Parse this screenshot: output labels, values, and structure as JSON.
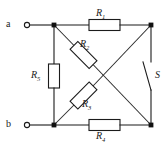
{
  "diagram": {
    "type": "electrical-schematic",
    "stroke_color": "#1b1b1b",
    "background_color": "#ffffff"
  },
  "terminals": [
    {
      "id": "a",
      "label": "a",
      "position": "top-left",
      "x": 24,
      "y": 25
    },
    {
      "id": "b",
      "label": "b",
      "position": "bottom-left",
      "x": 24,
      "y": 125
    }
  ],
  "nodes": [
    {
      "id": "top-left",
      "x": 54,
      "y": 25
    },
    {
      "id": "top-right",
      "x": 151,
      "y": 25
    },
    {
      "id": "bottom-left",
      "x": 54,
      "y": 125
    },
    {
      "id": "bottom-right",
      "x": 151,
      "y": 125
    }
  ],
  "components": [
    {
      "id": "R1",
      "label": "R",
      "subscript": "1",
      "kind": "resistor",
      "orientation": "horizontal",
      "branch": "top-wire",
      "label_position": "above"
    },
    {
      "id": "R2",
      "label": "R",
      "subscript": "2",
      "kind": "resistor",
      "orientation": "diagonal",
      "branch": "top-left-to-bottom-right-diagonal",
      "label_position": "right"
    },
    {
      "id": "R3",
      "label": "R",
      "subscript": "3",
      "kind": "resistor",
      "orientation": "diagonal",
      "branch": "bottom-left-to-top-right-diagonal",
      "label_position": "right"
    },
    {
      "id": "R4",
      "label": "R",
      "subscript": "4",
      "kind": "resistor",
      "orientation": "horizontal",
      "branch": "bottom-wire",
      "label_position": "below"
    },
    {
      "id": "R5",
      "label": "R",
      "subscript": "5",
      "kind": "resistor",
      "orientation": "vertical",
      "branch": "left-wire",
      "label_position": "left"
    },
    {
      "id": "S",
      "label": "S",
      "kind": "switch",
      "state": "open",
      "orientation": "vertical",
      "branch": "right-wire",
      "label_position": "right"
    }
  ]
}
